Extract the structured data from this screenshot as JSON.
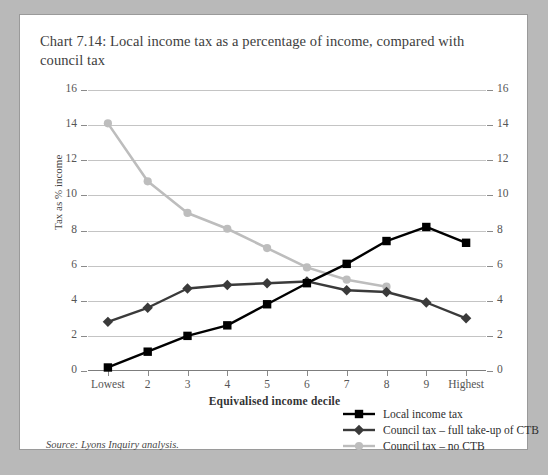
{
  "figure": {
    "title": "Chart 7.14: Local income tax as a percentage of income, compared with council tax",
    "source": "Source: Lyons Inquiry analysis."
  },
  "colors": {
    "series_local_income_tax": "#000000",
    "series_council_tax_full_ctb": "#3a3a3a",
    "series_council_tax_no_ctb": "#bdbdbd",
    "gridline": "#c4c4c4",
    "axis": "#7d7d7d",
    "panel_background": "#ffffff",
    "page_background": "#b9b9b9"
  },
  "chart_data": {
    "type": "line",
    "title": "Chart 7.14: Local income tax as a percentage of income, compared with council tax",
    "xlabel": "Equivalised income decile",
    "ylabel": "Tax as % income",
    "categories": [
      "Lowest",
      "2",
      "3",
      "4",
      "5",
      "6",
      "7",
      "8",
      "9",
      "Highest"
    ],
    "ylim": [
      0,
      16
    ],
    "yticks": [
      0,
      2,
      4,
      6,
      8,
      10,
      12,
      14,
      16
    ],
    "y_axis_right": true,
    "grid": true,
    "legend_position": "bottom-right",
    "series": [
      {
        "name": "Local income tax",
        "marker": "square",
        "color": "#000000",
        "values": [
          0.2,
          1.1,
          2.0,
          2.6,
          3.8,
          5.0,
          6.1,
          7.4,
          8.2,
          7.3
        ]
      },
      {
        "name": "Council tax – full take-up of CTB",
        "marker": "diamond",
        "color": "#3a3a3a",
        "values": [
          2.8,
          3.6,
          4.7,
          4.9,
          5.0,
          5.1,
          4.6,
          4.5,
          3.9,
          3.0
        ]
      },
      {
        "name": "Council tax – no CTB",
        "marker": "circle",
        "color": "#bdbdbd",
        "values": [
          14.1,
          10.8,
          9.0,
          8.1,
          7.0,
          5.9,
          5.2,
          4.8,
          null,
          null
        ]
      }
    ]
  }
}
